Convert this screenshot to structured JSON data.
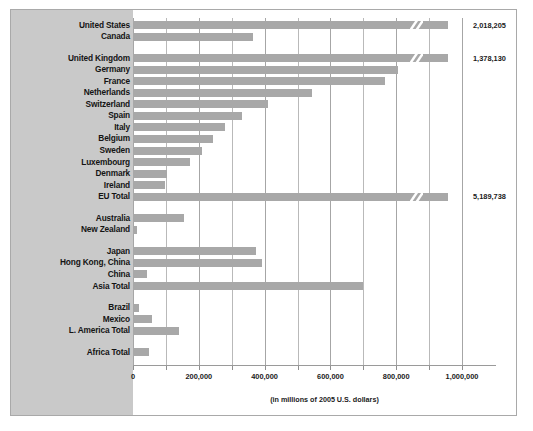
{
  "chart_data": {
    "type": "bar",
    "orientation": "horizontal",
    "title": "",
    "xlabel": "(in millions of 2005 U.S. dollars)",
    "ylabel": "",
    "xlim": [
      0,
      1000000
    ],
    "xticks": [
      0,
      100000,
      200000,
      300000,
      400000,
      500000,
      600000,
      700000,
      800000,
      900000,
      1000000
    ],
    "xtick_labels": [
      "0",
      "",
      "200,000",
      "",
      "400,000",
      "",
      "600,000",
      "",
      "800,000",
      "",
      "1,000,000"
    ],
    "grid": true,
    "legend": null,
    "bar_color": "#a8a8a8",
    "panel_color": "#c9c9c9",
    "note": "Bars for United States, United Kingdom and EU Total are truncated with a broken-axis zigzag; their true values are printed at the right.",
    "categories": [
      "United States",
      "Canada",
      "United Kingdom",
      "Germany",
      "France",
      "Netherlands",
      "Switzerland",
      "Spain",
      "Italy",
      "Belgium",
      "Sweden",
      "Luxembourg",
      "Denmark",
      "Ireland",
      "EU Total",
      "Australia",
      "New Zealand",
      "Japan",
      "Hong Kong, China",
      "China",
      "Asia Total",
      "Brazil",
      "Mexico",
      "L. America Total",
      "Africa Total"
    ],
    "values": [
      2018205,
      365000,
      1378130,
      805000,
      765000,
      545000,
      410000,
      330000,
      280000,
      243000,
      210000,
      172000,
      103000,
      97000,
      5189738,
      155000,
      12000,
      374000,
      392000,
      43000,
      700000,
      18000,
      58000,
      140000,
      48000
    ],
    "value_labels": [
      {
        "category": "United States",
        "text": "2,018,205"
      },
      {
        "category": "United Kingdom",
        "text": "1,378,130"
      },
      {
        "category": "EU Total",
        "text": "5,189,738"
      }
    ],
    "truncated": [
      "United States",
      "United Kingdom",
      "EU Total"
    ],
    "groups": [
      {
        "name": "North America",
        "categories": [
          "United States",
          "Canada"
        ]
      },
      {
        "name": "Europe",
        "categories": [
          "United Kingdom",
          "Germany",
          "France",
          "Netherlands",
          "Switzerland",
          "Spain",
          "Italy",
          "Belgium",
          "Sweden",
          "Luxembourg",
          "Denmark",
          "Ireland",
          "EU Total"
        ]
      },
      {
        "name": "Oceania",
        "categories": [
          "Australia",
          "New Zealand"
        ]
      },
      {
        "name": "Asia",
        "categories": [
          "Japan",
          "Hong Kong, China",
          "China",
          "Asia Total"
        ]
      },
      {
        "name": "Latin America",
        "categories": [
          "Brazil",
          "Mexico",
          "L. America Total"
        ]
      },
      {
        "name": "Africa",
        "categories": [
          "Africa Total"
        ]
      }
    ]
  }
}
